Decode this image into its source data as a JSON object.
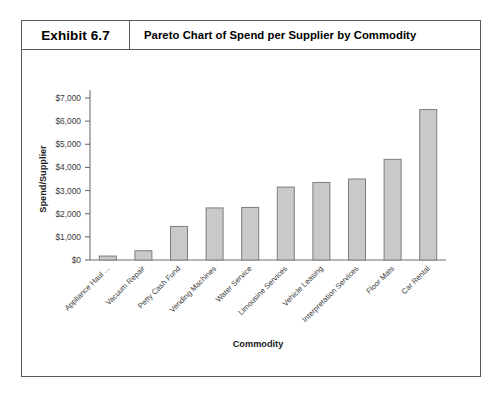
{
  "exhibit": {
    "number": "Exhibit 6.7",
    "title": "Pareto Chart of Spend per Supplier by Commodity"
  },
  "chart_data": {
    "type": "bar",
    "title": "Pareto Chart of Spend per Supplier by Commodity",
    "xlabel": "Commodity",
    "ylabel": "Spend/Supplier",
    "categories": [
      "Appliance Haul ...",
      "Vacuum Repair",
      "Petty Cash Fund",
      "Vending Machines",
      "Water Service",
      "Limousine Services",
      "Vehicle Leasing",
      "Interpretation Services",
      "Floor Mats",
      "Car Rental"
    ],
    "values": [
      170,
      400,
      1450,
      2250,
      2270,
      3150,
      3350,
      3500,
      4350,
      6500
    ],
    "ylim": [
      0,
      7000
    ],
    "ytick_values": [
      0,
      1000,
      2000,
      3000,
      4000,
      5000,
      6000,
      7000
    ],
    "ytick_labels": [
      "$0",
      "$1,000",
      "$2,000",
      "$3,000",
      "$4,000",
      "$5,000",
      "$6,000",
      "$7,000"
    ],
    "grid": false,
    "legend": false,
    "bar_fill": "#c9c9c9",
    "bar_stroke": "#7d7d7d",
    "axis_color": "#6e6f71"
  }
}
